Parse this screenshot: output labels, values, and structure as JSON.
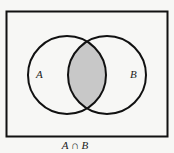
{
  "diagram": {
    "type": "venn",
    "sets": [
      {
        "label": "A",
        "cx": 67,
        "cy": 75,
        "r": 39
      },
      {
        "label": "B",
        "cx": 107,
        "cy": 75,
        "r": 39
      }
    ],
    "shaded_region": "intersection",
    "shade_color": "#c8c8c8",
    "stroke_color": "#111111",
    "caption": "A ∩ B"
  }
}
